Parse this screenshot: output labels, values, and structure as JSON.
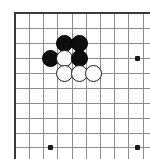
{
  "figure": {
    "kind": "go-board-diagram",
    "width": 150,
    "height": 159,
    "background_color": "#ffffff",
    "caption": ""
  },
  "board": {
    "grid_line_color": "#8d8d8d",
    "edge_line_color": "#3a3a3a",
    "grid_spacing": 14.3,
    "origin_x": 15,
    "origin_y": 13,
    "columns": 10,
    "rows": 10,
    "edges_visible": [
      "top",
      "left"
    ],
    "column_positions": [
      15,
      29,
      43,
      57,
      72,
      86,
      100,
      114,
      128,
      143
    ],
    "row_positions": [
      13,
      28,
      43,
      58,
      73,
      88,
      103,
      118,
      133,
      147
    ],
    "star_points": [
      {
        "name": "star-point-right-upper",
        "x": 137,
        "y": 58
      },
      {
        "name": "star-point-bottom-left",
        "x": 50,
        "y": 147
      },
      {
        "name": "star-point-bottom-right",
        "x": 137,
        "y": 147
      }
    ],
    "star_point_color": "#1a1a1a"
  },
  "stones": {
    "black_color": "#0d0d0d",
    "white_color": "#ffffff",
    "white_outline_color": "#1c1c1c",
    "diameter": 17,
    "items": [
      {
        "id": "black-stone-1",
        "color": "black",
        "x": 64,
        "y": 43
      },
      {
        "id": "black-stone-2",
        "color": "black",
        "x": 79,
        "y": 43
      },
      {
        "id": "black-stone-3",
        "color": "black",
        "x": 50,
        "y": 58
      },
      {
        "id": "white-stone-1",
        "color": "white",
        "x": 64,
        "y": 58
      },
      {
        "id": "black-stone-4",
        "color": "black",
        "x": 79,
        "y": 58
      },
      {
        "id": "white-stone-2",
        "color": "white",
        "x": 64,
        "y": 73
      },
      {
        "id": "white-stone-3",
        "color": "white",
        "x": 79,
        "y": 73
      },
      {
        "id": "white-stone-4",
        "color": "white",
        "x": 93,
        "y": 73
      }
    ]
  }
}
